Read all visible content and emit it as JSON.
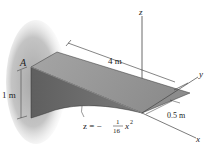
{
  "figure": {
    "labels": {
      "point_a": "A",
      "height": "1 m",
      "length": "4 m",
      "width": "0.5 m",
      "axis_x": "x",
      "axis_y": "y",
      "axis_z": "z",
      "curve_eq_lhs": "z = −",
      "curve_eq_num": "1",
      "curve_eq_den": "16",
      "curve_eq_var": "x",
      "curve_eq_exp": "2"
    },
    "colors": {
      "wall_shadow": "#b8b8b8",
      "top_face": "#9a9a9a",
      "side_face": "#6e6e6e",
      "line": "#333333"
    }
  }
}
